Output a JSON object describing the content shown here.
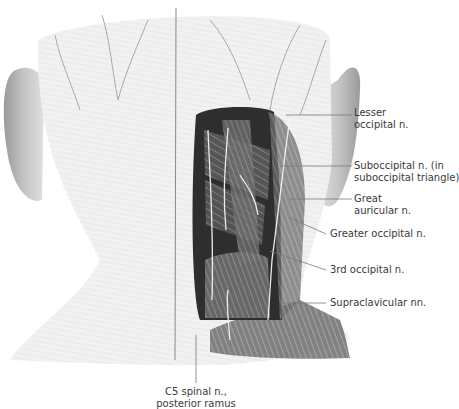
{
  "figure": {
    "colors": {
      "skin": "#f2f2f2",
      "skin_shade": "#d8d8d8",
      "muscle_dark": "#4a4a4a",
      "muscle_mid": "#8a8a8a",
      "nerve": "#f7f7f7",
      "leader_line": "#7a7a7a",
      "text": "#3a3a3a"
    },
    "labels": [
      {
        "id": "lesser-occipital",
        "lines": [
          "Lesser",
          "occipital n."
        ]
      },
      {
        "id": "suboccipital",
        "lines": [
          "Suboccipital n. (in",
          "suboccipital triangle)"
        ]
      },
      {
        "id": "great-auricular",
        "lines": [
          "Great",
          "auricular n."
        ]
      },
      {
        "id": "greater-occipital",
        "lines": [
          "Greater occipital n."
        ]
      },
      {
        "id": "third-occipital",
        "lines": [
          "3rd occipital n."
        ]
      },
      {
        "id": "supraclavicular",
        "lines": [
          "Supraclavicular nn."
        ]
      },
      {
        "id": "c5-spinal",
        "lines": [
          "C5 spinal n.,",
          "posterior ramus"
        ]
      }
    ],
    "signatures": [
      "K. Wesker",
      "K. Wesker"
    ]
  }
}
